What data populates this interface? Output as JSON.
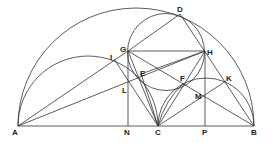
{
  "diagram": {
    "type": "geometric-construction",
    "colors": {
      "line": "#333333",
      "label": "#222222",
      "background": "#ffffff"
    },
    "points": {
      "A": {
        "x": 18,
        "y": 126,
        "label": "A"
      },
      "B": {
        "x": 254,
        "y": 126,
        "label": "B"
      },
      "C": {
        "x": 158,
        "y": 126,
        "label": "C"
      },
      "N": {
        "x": 128,
        "y": 126,
        "label": "N"
      },
      "P": {
        "x": 205,
        "y": 126,
        "label": "P"
      },
      "D": {
        "x": 180,
        "y": 14,
        "label": "D"
      },
      "G": {
        "x": 128,
        "y": 51,
        "label": "G"
      },
      "H": {
        "x": 205,
        "y": 51,
        "label": "H"
      },
      "E": {
        "x": 141,
        "y": 74,
        "label": "E"
      },
      "F": {
        "x": 184,
        "y": 83,
        "label": "F"
      },
      "I": {
        "x": 114,
        "y": 59,
        "label": "I"
      },
      "L": {
        "x": 128,
        "y": 80,
        "label": "L"
      },
      "M": {
        "x": 205,
        "y": 96,
        "label": "M"
      },
      "K": {
        "x": 226,
        "y": 81,
        "label": "K"
      }
    },
    "labels": [
      "A",
      "B",
      "C",
      "D",
      "E",
      "F",
      "G",
      "H",
      "I",
      "K",
      "L",
      "M",
      "N",
      "P"
    ]
  }
}
